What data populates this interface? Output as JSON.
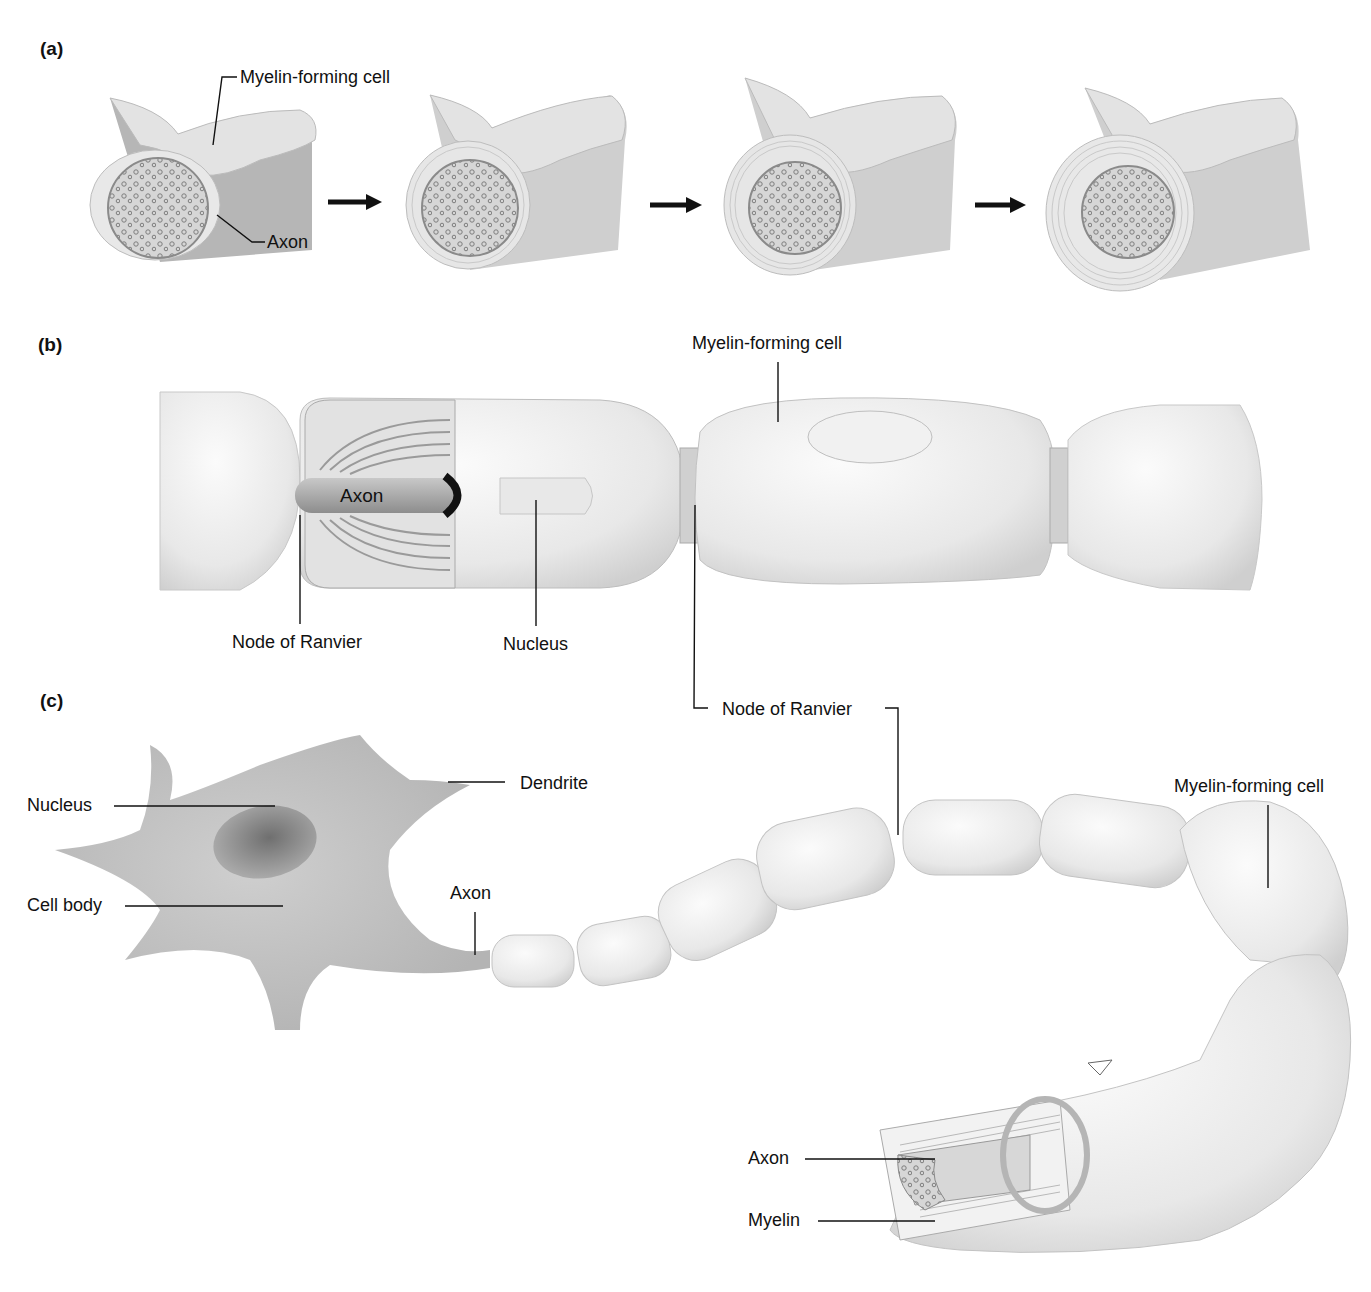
{
  "figure": {
    "panels": [
      {
        "id": "a",
        "label": "(a)",
        "stages": 4,
        "arrows": 3,
        "labels": {
          "myelin_forming_cell": "Myelin-forming cell",
          "axon": "Axon"
        }
      },
      {
        "id": "b",
        "label": "(b)",
        "labels": {
          "myelin_forming_cell": "Myelin-forming cell",
          "axon": "Axon",
          "node_of_ranvier_left": "Node of Ranvier",
          "nucleus": "Nucleus",
          "node_of_ranvier_right": "Node of Ranvier"
        }
      },
      {
        "id": "c",
        "label": "(c)",
        "labels": {
          "nucleus": "Nucleus",
          "dendrite": "Dendrite",
          "cell_body": "Cell body",
          "axon": "Axon",
          "myelin_forming_cell": "Myelin-forming cell",
          "cutaway_axon": "Axon",
          "myelin": "Myelin"
        }
      }
    ]
  },
  "colors": {
    "background": "#ffffff",
    "cell_fill": "#ececec",
    "cell_shade": "#d2d2d2",
    "cell_body": "#bdbdbd",
    "nucleus_dark": "#7a7a7a",
    "axon_dark": "#9a9a9a",
    "leader_line": "#111111"
  }
}
